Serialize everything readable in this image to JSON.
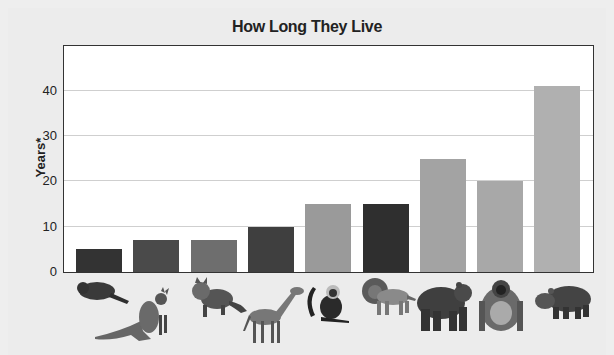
{
  "chart_data": {
    "type": "bar",
    "title": "How Long They Live",
    "xlabel": "",
    "ylabel": "Years*",
    "ylim": [
      0,
      45
    ],
    "yticks": [
      0,
      10,
      20,
      30,
      40
    ],
    "grid": true,
    "legend": null,
    "categories": [
      "Beaver",
      "Kangaroo",
      "Fox",
      "Giraffe",
      "Monkey",
      "Lion",
      "Bear",
      "Gorilla",
      "Hippopotamus"
    ],
    "values": [
      5,
      7,
      7,
      10,
      15,
      15,
      25,
      20,
      41
    ],
    "colors": [
      "#333333",
      "#4a4a4a",
      "#6e6e6e",
      "#3f3f3f",
      "#9a9a9a",
      "#2f2f2f",
      "#a3a3a3",
      "#a8a8a8",
      "#b0b0b0"
    ],
    "category_icons": [
      "beaver-icon",
      "kangaroo-icon",
      "fox-icon",
      "giraffe-icon",
      "monkey-icon",
      "lion-icon",
      "bear-icon",
      "gorilla-icon",
      "hippo-icon"
    ]
  },
  "labels": {
    "title": "How Long They Live",
    "ylabel": "Years*",
    "yticks": [
      "0",
      "10",
      "20",
      "30",
      "40"
    ]
  }
}
